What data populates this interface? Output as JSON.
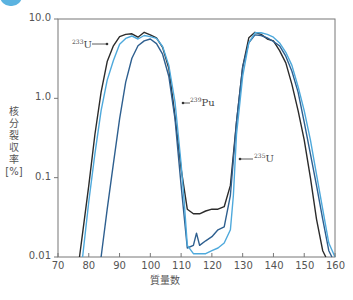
{
  "chart_data": {
    "type": "line",
    "title": "",
    "xlabel": "質量数",
    "ylabel": "核分裂収率 [%]",
    "ylabel_chars": [
      "核",
      "分",
      "裂",
      "収",
      "率",
      "[%]"
    ],
    "xscale": "linear",
    "yscale": "log",
    "xlim": [
      70,
      160
    ],
    "ylim": [
      0.01,
      10.0
    ],
    "xticks": [
      70,
      80,
      90,
      100,
      110,
      120,
      130,
      140,
      150,
      160
    ],
    "yticks": [
      0.01,
      0.1,
      1.0,
      10.0
    ],
    "ytick_labels": [
      "0.01",
      "0.1",
      "1.0",
      "10.0"
    ],
    "grid": false,
    "legend": "none (inline annotations)",
    "annotations": [
      {
        "label_sup": "233",
        "label_main": "U",
        "series": "233U",
        "x": 84,
        "y": 5.0
      },
      {
        "label_sup": "239",
        "label_main": "Pu",
        "series": "239Pu",
        "x": 109,
        "y": 1.0
      },
      {
        "label_sup": "235",
        "label_main": "U",
        "series": "235U",
        "x": 125,
        "y": 0.2
      }
    ],
    "series": [
      {
        "name": "233U",
        "color": "#2b2b2b",
        "x": [
          77,
          78,
          80,
          82,
          84,
          86,
          88,
          90,
          92,
          94,
          96,
          98,
          100,
          102,
          104,
          106,
          108,
          110,
          112,
          114,
          116,
          118,
          120,
          122,
          124,
          126,
          128,
          130,
          132,
          134,
          136,
          138,
          140,
          142,
          144,
          146,
          148,
          150,
          152,
          154,
          156,
          157
        ],
        "y": [
          0.01,
          0.02,
          0.08,
          0.35,
          1.2,
          2.9,
          4.6,
          6.0,
          6.4,
          6.5,
          5.9,
          6.8,
          6.3,
          5.8,
          4.4,
          2.4,
          0.6,
          0.13,
          0.04,
          0.035,
          0.035,
          0.038,
          0.04,
          0.04,
          0.043,
          0.08,
          0.5,
          2.5,
          5.8,
          6.8,
          6.4,
          5.6,
          5.3,
          4.0,
          2.8,
          1.5,
          0.7,
          0.3,
          0.1,
          0.03,
          0.012,
          0.01
        ]
      },
      {
        "name": "239Pu",
        "color": "#2e5f8f",
        "x": [
          84,
          86,
          88,
          90,
          92,
          94,
          96,
          98,
          100,
          102,
          104,
          106,
          108,
          110,
          112,
          114,
          115,
          116,
          118,
          120,
          122,
          124,
          126,
          128,
          130,
          132,
          134,
          136,
          138,
          140,
          142,
          144,
          146,
          148,
          150,
          152,
          154,
          156,
          158,
          159
        ],
        "y": [
          0.01,
          0.04,
          0.15,
          0.55,
          1.6,
          3.2,
          4.6,
          5.3,
          5.6,
          4.9,
          3.6,
          1.9,
          0.55,
          0.08,
          0.013,
          0.014,
          0.02,
          0.014,
          0.016,
          0.018,
          0.022,
          0.024,
          0.06,
          0.5,
          2.5,
          5.0,
          6.3,
          6.2,
          5.8,
          5.2,
          4.6,
          3.4,
          2.2,
          1.2,
          0.5,
          0.2,
          0.08,
          0.03,
          0.012,
          0.01
        ]
      },
      {
        "name": "235U",
        "color": "#4ea9dc",
        "x": [
          78,
          80,
          82,
          84,
          86,
          88,
          90,
          92,
          94,
          96,
          98,
          100,
          102,
          104,
          106,
          108,
          110,
          111,
          112,
          114,
          116,
          118,
          120,
          122,
          124,
          126,
          127,
          128,
          130,
          132,
          134,
          136,
          138,
          140,
          142,
          144,
          146,
          148,
          150,
          152,
          154,
          156,
          158,
          160
        ],
        "y": [
          0.01,
          0.05,
          0.2,
          0.7,
          1.7,
          3.0,
          4.8,
          5.7,
          6.1,
          5.6,
          6.2,
          6.0,
          5.7,
          4.5,
          2.6,
          0.9,
          0.15,
          0.05,
          0.014,
          0.011,
          0.011,
          0.011,
          0.012,
          0.013,
          0.015,
          0.022,
          0.06,
          0.35,
          1.9,
          5.0,
          6.7,
          6.7,
          6.4,
          5.9,
          5.0,
          3.8,
          2.6,
          1.4,
          0.7,
          0.3,
          0.11,
          0.04,
          0.015,
          0.01
        ]
      }
    ]
  }
}
